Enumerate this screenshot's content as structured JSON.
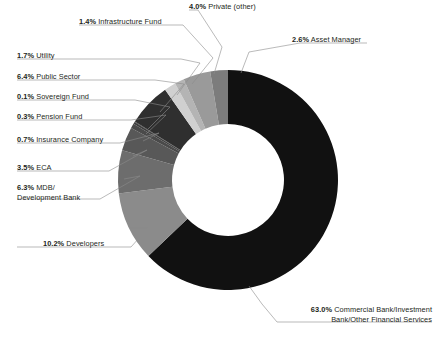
{
  "chart_data": {
    "type": "pie",
    "variant": "donut",
    "title": "",
    "subtitle": "",
    "xlabel": "",
    "ylabel": "",
    "legend_position": "none",
    "grid": false,
    "value_suffix": "%",
    "categories": [
      "Commercial Bank/Investment Bank/Other Financial Services",
      "Developers",
      "MDB/Development Bank",
      "ECA",
      "Insurance Company",
      "Pension Fund",
      "Sovereign Fund",
      "Public Sector",
      "Utility",
      "Infrastructure Fund",
      "Private (other)",
      "Asset Manager"
    ],
    "values": [
      63.0,
      10.2,
      6.3,
      3.5,
      0.7,
      0.3,
      0.1,
      6.4,
      1.7,
      1.4,
      4.0,
      2.6
    ],
    "colors": [
      "#111111",
      "#8b8b8b",
      "#6d6d6d",
      "#585858",
      "#4a4a4a",
      "#3f3f3f",
      "#3a3a3a",
      "#2f2f2f",
      "#d0d0d0",
      "#b4b4b4",
      "#9a9a9a",
      "#7c7c7c"
    ],
    "slices": [
      {
        "pct": "63.0%",
        "name": "Commercial Bank/Investment",
        "name2": "Bank/Other Financial Services",
        "value": 63.0,
        "color": "#111111"
      },
      {
        "pct": "10.2%",
        "name": "Developers",
        "value": 10.2,
        "color": "#8b8b8b"
      },
      {
        "pct": "6.3%",
        "name": "MDB/",
        "name2": "Development Bank",
        "value": 6.3,
        "color": "#6d6d6d"
      },
      {
        "pct": "3.5%",
        "name": "ECA",
        "value": 3.5,
        "color": "#585858"
      },
      {
        "pct": "0.7%",
        "name": "Insurance Company",
        "value": 0.7,
        "color": "#4a4a4a"
      },
      {
        "pct": "0.3%",
        "name": "Pension Fund",
        "value": 0.3,
        "color": "#3f3f3f"
      },
      {
        "pct": "0.1%",
        "name": "Sovereign Fund",
        "value": 0.1,
        "color": "#3a3a3a"
      },
      {
        "pct": "6.4%",
        "name": "Public Sector",
        "value": 6.4,
        "color": "#2f2f2f"
      },
      {
        "pct": "1.7%",
        "name": "Utility",
        "value": 1.7,
        "color": "#d0d0d0"
      },
      {
        "pct": "1.4%",
        "name": "Infrastructure Fund",
        "value": 1.4,
        "color": "#b4b4b4"
      },
      {
        "pct": "4.0%",
        "name": "Private (other)",
        "value": 4.0,
        "color": "#9a9a9a"
      },
      {
        "pct": "2.6%",
        "name": "Asset Manager",
        "value": 2.6,
        "color": "#7c7c7c"
      }
    ]
  },
  "labels": {
    "infrastructure_fund": {
      "pct": "1.4%",
      "name": "Infrastructure Fund"
    },
    "private_other": {
      "pct": "4.0%",
      "name": "Private (other)"
    },
    "asset_manager": {
      "pct": "2.6%",
      "name": "Asset Manager"
    },
    "utility": {
      "pct": "1.7%",
      "name": "Utility"
    },
    "public_sector": {
      "pct": "6.4%",
      "name": "Public Sector"
    },
    "sovereign_fund": {
      "pct": "0.1%",
      "name": "Sovereign Fund"
    },
    "pension_fund": {
      "pct": "0.3%",
      "name": "Pension Fund"
    },
    "insurance_company": {
      "pct": "0.7%",
      "name": "Insurance Company"
    },
    "eca": {
      "pct": "3.5%",
      "name": "ECA"
    },
    "mdb": {
      "pct": "6.3%",
      "name": "MDB/",
      "name2": "Development Bank"
    },
    "developers": {
      "pct": "10.2%",
      "name": "Developers"
    },
    "commercial_bank": {
      "pct": "63.0%",
      "name": "Commercial Bank/Investment",
      "name2": "Bank/Other Financial Services"
    }
  },
  "style": {
    "background": "#ffffff",
    "text_color": "#231f20",
    "leader_line_color": "#8c8c8c"
  }
}
